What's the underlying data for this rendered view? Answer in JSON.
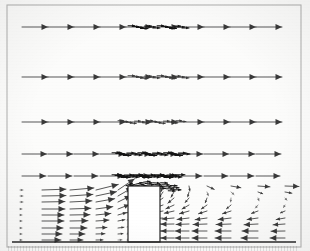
{
  "figure": {
    "kind": "vector-field-plot",
    "title": ""
  },
  "colors": {
    "ink": "#141414",
    "ink_light": "#5b5b5b",
    "ink_faint": "#8f8f8f",
    "paper": "#fcfcfb",
    "frame": "#b5b5b5",
    "ground": "#2a2a2a",
    "building_fill": "#ffffff",
    "building_stroke": "#1a1a1a"
  },
  "frame": {
    "name": "plot-border",
    "x": 7,
    "y": 5,
    "width": 294,
    "height": 242,
    "stroke_width": 1.1
  },
  "ground": {
    "name": "ground-line",
    "x1": 12,
    "x2": 296,
    "y": 242,
    "stroke_width": 1.3
  },
  "building": {
    "name": "building-obstacle",
    "x": 128,
    "y": 186,
    "width": 32,
    "height": 56,
    "label": "building"
  },
  "chart_data": {
    "type": "scatter",
    "xlabel": "streamwise distance",
    "ylabel": "height",
    "xlim": [
      7,
      301
    ],
    "ylim": [
      5,
      247
    ],
    "grid": false,
    "legend": null,
    "glyph": "arrow",
    "notes": [
      "Rows 1-4 are uniform free-stream rows with long horizontal arrows; arrows bunch into dark overlapping clusters above the building where sampling is dense.",
      "Row 5 sits just above roof height and contains a dark convergent shear-layer cluster.",
      "Lower-left block: boundary-layer rows with arrows shortening toward the ground and tilting upward as they approach the windward wall.",
      "Downstream block right of the building: short reversed (leftward) arrows forming the wake/recirculation; near-roof arrows tilt downward."
    ],
    "rows": [
      {
        "name": "freestream-row-1",
        "y": 27,
        "kind": "uniform",
        "arrow_length": 26,
        "angle_deg": 0,
        "x_start": 22,
        "x_step": 26,
        "count": 11,
        "cluster": {
          "x_start": 128,
          "x_end": 182,
          "count": 14,
          "length": 7,
          "weight": "heavy"
        }
      },
      {
        "name": "freestream-row-2",
        "y": 77,
        "kind": "uniform",
        "arrow_length": 26,
        "angle_deg": 0,
        "x_start": 22,
        "x_step": 26,
        "count": 11,
        "cluster": {
          "x_start": 128,
          "x_end": 182,
          "count": 14,
          "length": 7,
          "weight": "medium"
        }
      },
      {
        "name": "freestream-row-3",
        "y": 122,
        "kind": "uniform",
        "arrow_length": 26,
        "angle_deg": 0,
        "x_start": 22,
        "x_step": 26,
        "count": 11,
        "cluster": {
          "x_start": 118,
          "x_end": 180,
          "count": 16,
          "length": 6,
          "weight": "medium"
        }
      },
      {
        "name": "freestream-row-4",
        "y": 154,
        "kind": "uniform",
        "arrow_length": 25,
        "angle_deg": 0,
        "x_start": 22,
        "x_step": 26,
        "count": 11,
        "cluster": {
          "x_start": 112,
          "x_end": 182,
          "count": 20,
          "length": 8,
          "weight": "heavy"
        }
      },
      {
        "name": "shear-layer-row-5",
        "y": 176,
        "kind": "uniform",
        "arrow_length": 24,
        "angle_deg": 0,
        "x_start": 22,
        "x_step": 26,
        "count": 11,
        "cluster": {
          "x_start": 112,
          "x_end": 176,
          "count": 22,
          "length": 9,
          "weight": "heavy"
        }
      }
    ],
    "upstream_columns": [
      {
        "name": "col-u1",
        "x": 20,
        "lengths": [
          3,
          3,
          3,
          2,
          2,
          2,
          2,
          2,
          2
        ],
        "angles": [
          0,
          0,
          0,
          0,
          0,
          0,
          0,
          0,
          0
        ]
      },
      {
        "name": "col-u2",
        "x": 42,
        "lengths": [
          24,
          24,
          23,
          23,
          22,
          22,
          21,
          20,
          19
        ],
        "angles": [
          2,
          1,
          1,
          0,
          0,
          0,
          0,
          0,
          0
        ]
      },
      {
        "name": "col-u3",
        "x": 70,
        "lengths": [
          24,
          23,
          22,
          21,
          20,
          18,
          17,
          15,
          13
        ],
        "angles": [
          5,
          4,
          3,
          2,
          1,
          1,
          0,
          0,
          0
        ]
      },
      {
        "name": "col-u4",
        "x": 96,
        "lengths": [
          23,
          21,
          19,
          17,
          15,
          13,
          11,
          9,
          7
        ],
        "angles": [
          14,
          12,
          10,
          8,
          6,
          4,
          3,
          2,
          1
        ]
      },
      {
        "name": "col-u5",
        "x": 118,
        "lengths": [
          20,
          17,
          14,
          12,
          9,
          7,
          6,
          5,
          4
        ],
        "angles": [
          34,
          30,
          26,
          21,
          16,
          11,
          7,
          4,
          2
        ]
      }
    ],
    "upstream_row_y": [
      190,
      196,
      202,
      209,
      215,
      221,
      228,
      234,
      240
    ],
    "wake_row_y": [
      186,
      192,
      198,
      205,
      211,
      218,
      224,
      231,
      238
    ],
    "wake_columns": [
      {
        "name": "col-w1",
        "x": 163,
        "lengths": [
          6,
          7,
          8,
          9,
          10,
          11,
          12,
          12,
          12
        ],
        "angles": [
          250,
          235,
          215,
          200,
          190,
          184,
          180,
          180,
          180
        ]
      },
      {
        "name": "col-w2",
        "x": 174,
        "lengths": [
          5,
          6,
          8,
          9,
          10,
          12,
          13,
          13,
          13
        ],
        "angles": [
          260,
          240,
          220,
          205,
          193,
          185,
          181,
          180,
          180
        ]
      },
      {
        "name": "col-w3",
        "x": 189,
        "lengths": [
          5,
          5,
          6,
          8,
          10,
          12,
          13,
          14,
          14
        ],
        "angles": [
          280,
          255,
          230,
          210,
          196,
          187,
          182,
          180,
          180
        ]
      },
      {
        "name": "col-w4",
        "x": 207,
        "lengths": [
          8,
          4,
          5,
          7,
          9,
          12,
          14,
          15,
          15
        ],
        "angles": [
          335,
          290,
          250,
          215,
          198,
          188,
          182,
          180,
          180
        ]
      },
      {
        "name": "col-w5",
        "x": 231,
        "lengths": [
          10,
          4,
          4,
          6,
          9,
          13,
          15,
          16,
          16
        ],
        "angles": [
          350,
          320,
          265,
          220,
          198,
          187,
          182,
          180,
          180
        ]
      },
      {
        "name": "col-w6",
        "x": 258,
        "lengths": [
          12,
          5,
          3,
          4,
          7,
          11,
          14,
          16,
          17
        ],
        "angles": [
          356,
          340,
          290,
          230,
          200,
          188,
          183,
          180,
          180
        ]
      },
      {
        "name": "col-w7",
        "x": 285,
        "lengths": [
          14,
          7,
          3,
          3,
          5,
          9,
          12,
          14,
          15
        ],
        "angles": [
          358,
          350,
          310,
          240,
          203,
          190,
          184,
          181,
          180
        ]
      }
    ],
    "windward_wall_column": {
      "name": "col-windward-wall",
      "x": 127,
      "row_y": [
        192,
        199,
        206,
        213,
        220,
        227,
        234,
        240
      ],
      "lengths": [
        9,
        7,
        6,
        5,
        4,
        4,
        3,
        3
      ],
      "angles": [
        62,
        52,
        42,
        32,
        24,
        16,
        10,
        6
      ]
    },
    "roof_plume": {
      "name": "roof-plume-cluster",
      "x": 126,
      "y": 182,
      "width": 48,
      "height": 14,
      "count": 26,
      "weight": "heavy"
    }
  }
}
